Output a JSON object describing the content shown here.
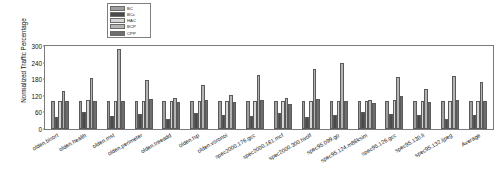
{
  "chart_data": {
    "type": "bar",
    "title": "",
    "xlabel": "",
    "ylabel": "Normalized Traffic Percentage",
    "ylim": [
      0,
      300
    ],
    "yticks": [
      0,
      60,
      120,
      180,
      240,
      300
    ],
    "grid": false,
    "legend_position": "top-center",
    "categories": [
      "olden.bisort",
      "olden.health",
      "olden.mst",
      "olden.perimeter",
      "olden.treeadd",
      "olden.tsp",
      "olden.voronoi",
      "spec2000.176.gcc",
      "spec2000.181.mcf",
      "spec2000.300.twolf",
      "spec95.099.go",
      "spec95.124.m88ksim",
      "spec95.126.gcc",
      "spec95.130.li",
      "spec95.132.ijpeg",
      "Average"
    ],
    "series": [
      {
        "name": "BC",
        "color": "#9e9e9e",
        "values": [
          100,
          100,
          100,
          100,
          100,
          100,
          100,
          100,
          100,
          100,
          100,
          100,
          100,
          100,
          100,
          100
        ]
      },
      {
        "name": "BCc",
        "color": "#4a4a4a",
        "values": [
          42,
          62,
          48,
          54,
          38,
          58,
          52,
          46,
          58,
          44,
          52,
          60,
          56,
          50,
          36,
          50
        ]
      },
      {
        "name": "HAC",
        "color": "#d6d6d6",
        "values": [
          102,
          104,
          101,
          100,
          102,
          102,
          103,
          101,
          102,
          101,
          103,
          102,
          104,
          101,
          100,
          102
        ]
      },
      {
        "name": "BCP",
        "color": "#b5b5b5",
        "values": [
          138,
          186,
          290,
          178,
          112,
          158,
          122,
          196,
          112,
          216,
          240,
          104,
          188,
          146,
          192,
          170
        ]
      },
      {
        "name": "CPP",
        "color": "#6e6e6e",
        "values": [
          100,
          100,
          100,
          110,
          96,
          104,
          98,
          106,
          92,
          108,
          102,
          94,
          118,
          96,
          104,
          102
        ]
      }
    ]
  },
  "legend": {
    "items": [
      {
        "label": "BC",
        "color": "#9e9e9e"
      },
      {
        "label": "BCc",
        "color": "#4a4a4a"
      },
      {
        "label": "HAC",
        "color": "#d6d6d6"
      },
      {
        "label": "BCP",
        "color": "#b5b5b5"
      },
      {
        "label": "CPP",
        "color": "#6e6e6e"
      }
    ]
  }
}
